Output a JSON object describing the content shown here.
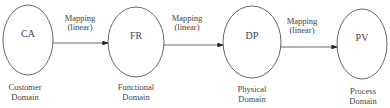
{
  "diagram": {
    "nodes": [
      {
        "id": "CA",
        "label": "CA",
        "domain_line1": "Customer",
        "domain_line2": "Domain"
      },
      {
        "id": "FR",
        "label": "FR",
        "domain_line1": "Functional",
        "domain_line2": "Domain"
      },
      {
        "id": "DP",
        "label": "DP",
        "domain_line1": "Physical",
        "domain_line2": "Domain"
      },
      {
        "id": "PV",
        "label": "PV",
        "domain_line1": "Process",
        "domain_line2": "Domain"
      }
    ],
    "edges": [
      {
        "from": "CA",
        "to": "FR",
        "line1": "Mapping",
        "line2": "(linear)"
      },
      {
        "from": "FR",
        "to": "DP",
        "line1": "Mapping",
        "line2": "(linear)"
      },
      {
        "from": "DP",
        "to": "PV",
        "line1": "Mapping",
        "line2": "(linear)"
      }
    ]
  }
}
